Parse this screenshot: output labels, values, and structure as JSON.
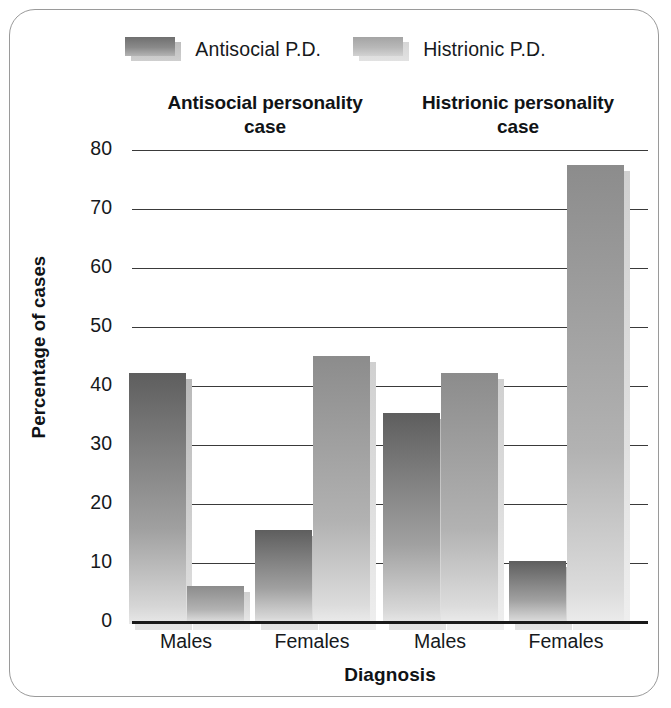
{
  "figure": {
    "background_color": "#ffffff",
    "frame_color": "#9a9a9a"
  },
  "legend": {
    "position": "top",
    "entries": [
      {
        "label": "Antisocial P.D.",
        "swatch": "antisocial-swatch",
        "color": "#7c7c7c"
      },
      {
        "label": "Histrionic P.D.",
        "swatch": "histrionic-swatch",
        "color": "#b2b2b2"
      }
    ]
  },
  "panels": [
    {
      "title_line1": "Antisocial personality",
      "title_line2": "case"
    },
    {
      "title_line1": "Histrionic personality",
      "title_line2": "case"
    }
  ],
  "axes": {
    "ylabel": "Percentage of cases",
    "xlabel": "Diagnosis",
    "yticks": [
      "80",
      "70",
      "60",
      "50",
      "40",
      "30",
      "20",
      "10",
      "0"
    ],
    "xticks": [
      "Males",
      "Females",
      "Males",
      "Females"
    ]
  },
  "chart_data": {
    "type": "bar",
    "title": "",
    "subtitle": "",
    "xlabel": "Diagnosis",
    "ylabel": "Percentage of cases",
    "ylim": [
      0,
      80
    ],
    "ytick_step": 10,
    "grid": true,
    "legend_position": "top",
    "panel_titles": [
      "Antisocial personality case",
      "Histrionic personality case"
    ],
    "categories": [
      "Antisocial case / Males",
      "Antisocial case / Females",
      "Histrionic case / Males",
      "Histrionic case / Females"
    ],
    "series": [
      {
        "name": "Antisocial P.D.",
        "color": "#7c7c7c",
        "values": [
          42.5,
          16.0,
          35.8,
          10.7
        ]
      },
      {
        "name": "Histrionic P.D.",
        "color": "#b2b2b2",
        "values": [
          6.5,
          45.5,
          42.5,
          77.8
        ]
      }
    ]
  }
}
